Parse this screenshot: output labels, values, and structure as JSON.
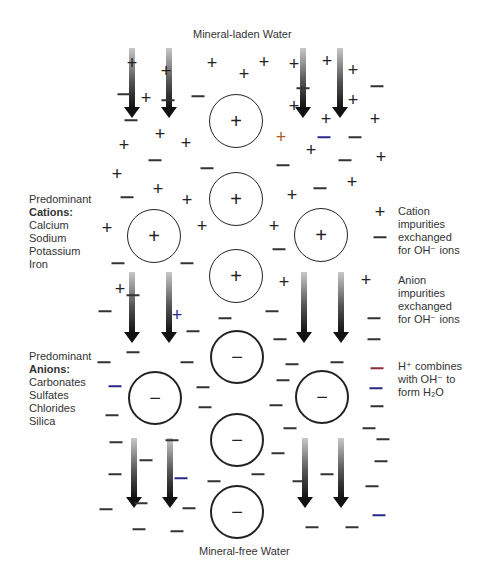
{
  "title_top": "Mineral-laden Water",
  "title_bottom": "Mineral-free Water",
  "left_labels": {
    "cations": {
      "heading": "Predominant",
      "bold": "Cations:",
      "items": [
        "Calcium",
        "Sodium",
        "Potassium",
        "Iron"
      ]
    },
    "anions": {
      "heading": "Predominant",
      "bold": "Anions:",
      "items": [
        "Carbonates",
        "Sulfates",
        "Chlorides",
        "Silica"
      ]
    }
  },
  "right_labels": {
    "cation_exchange": [
      "Cation",
      "impurities",
      "exchanged",
      "for OH⁻ ions"
    ],
    "anion_exchange": [
      "Anion",
      "impurities",
      "exchanged",
      "for OH⁻ ions"
    ],
    "h_combines": [
      "H⁺ combines",
      "with OH⁻ to",
      "form H₂O"
    ]
  },
  "colors": {
    "stroke": "#222222",
    "accent_red_dash": "#8a2a3a",
    "accent_blue_dash": "#2a2a8a",
    "accent_orange_plus": "#b0602a"
  },
  "resin_beads": [
    {
      "cx": 236,
      "cy": 121,
      "r": 27,
      "symbol": "+",
      "type": "cation"
    },
    {
      "cx": 236,
      "cy": 199,
      "r": 27,
      "symbol": "+",
      "type": "cation"
    },
    {
      "cx": 154,
      "cy": 236,
      "r": 27,
      "symbol": "+",
      "type": "cation"
    },
    {
      "cx": 321,
      "cy": 235,
      "r": 27,
      "symbol": "+",
      "type": "cation"
    },
    {
      "cx": 236,
      "cy": 276,
      "r": 27,
      "symbol": "+",
      "type": "cation"
    },
    {
      "cx": 237,
      "cy": 357,
      "r": 27,
      "symbol": "−",
      "type": "anion"
    },
    {
      "cx": 155,
      "cy": 398,
      "r": 27,
      "symbol": "−",
      "type": "anion"
    },
    {
      "cx": 322,
      "cy": 397,
      "r": 27,
      "symbol": "−",
      "type": "anion"
    },
    {
      "cx": 237,
      "cy": 440,
      "r": 27,
      "symbol": "−",
      "type": "anion"
    },
    {
      "cx": 237,
      "cy": 512,
      "r": 27,
      "symbol": "−",
      "type": "anion"
    }
  ],
  "flow_arrows": [
    {
      "x": 132,
      "y1": 48,
      "y2": 118
    },
    {
      "x": 169,
      "y1": 48,
      "y2": 118
    },
    {
      "x": 303,
      "y1": 48,
      "y2": 118
    },
    {
      "x": 340,
      "y1": 48,
      "y2": 118
    },
    {
      "x": 132,
      "y1": 272,
      "y2": 343
    },
    {
      "x": 169,
      "y1": 272,
      "y2": 343
    },
    {
      "x": 304,
      "y1": 272,
      "y2": 343
    },
    {
      "x": 341,
      "y1": 272,
      "y2": 343
    },
    {
      "x": 134,
      "y1": 438,
      "y2": 508
    },
    {
      "x": 170,
      "y1": 438,
      "y2": 508
    },
    {
      "x": 305,
      "y1": 438,
      "y2": 508
    },
    {
      "x": 341,
      "y1": 438,
      "y2": 508
    }
  ],
  "plus_ions": [
    {
      "x": 132,
      "y": 63
    },
    {
      "x": 166,
      "y": 71
    },
    {
      "x": 212,
      "y": 63
    },
    {
      "x": 244,
      "y": 74
    },
    {
      "x": 264,
      "y": 62
    },
    {
      "x": 294,
      "y": 64
    },
    {
      "x": 327,
      "y": 61
    },
    {
      "x": 353,
      "y": 70
    },
    {
      "x": 146,
      "y": 98
    },
    {
      "x": 294,
      "y": 106
    },
    {
      "x": 353,
      "y": 100
    },
    {
      "x": 326,
      "y": 119
    },
    {
      "x": 375,
      "y": 119
    },
    {
      "x": 124,
      "y": 145
    },
    {
      "x": 160,
      "y": 134
    },
    {
      "x": 186,
      "y": 143
    },
    {
      "x": 281,
      "y": 137,
      "color": "accent_orange_plus"
    },
    {
      "x": 311,
      "y": 150
    },
    {
      "x": 381,
      "y": 157
    },
    {
      "x": 117,
      "y": 174
    },
    {
      "x": 158,
      "y": 189
    },
    {
      "x": 187,
      "y": 200
    },
    {
      "x": 292,
      "y": 195
    },
    {
      "x": 352,
      "y": 182
    },
    {
      "x": 107,
      "y": 228
    },
    {
      "x": 202,
      "y": 226
    },
    {
      "x": 274,
      "y": 226
    },
    {
      "x": 380,
      "y": 212
    },
    {
      "x": 120,
      "y": 289
    },
    {
      "x": 284,
      "y": 282
    },
    {
      "x": 366,
      "y": 280
    },
    {
      "x": 177,
      "y": 315,
      "color": "accent_blue_dash"
    }
  ],
  "minus_ions": [
    {
      "x": 124,
      "y": 94
    },
    {
      "x": 168,
      "y": 100
    },
    {
      "x": 198,
      "y": 96
    },
    {
      "x": 303,
      "y": 88
    },
    {
      "x": 377,
      "y": 86
    },
    {
      "x": 131,
      "y": 120
    },
    {
      "x": 355,
      "y": 137
    },
    {
      "x": 324,
      "y": 137,
      "color": "accent_blue_dash"
    },
    {
      "x": 155,
      "y": 160
    },
    {
      "x": 207,
      "y": 168
    },
    {
      "x": 283,
      "y": 165
    },
    {
      "x": 345,
      "y": 160
    },
    {
      "x": 127,
      "y": 197
    },
    {
      "x": 320,
      "y": 188
    },
    {
      "x": 380,
      "y": 237
    },
    {
      "x": 279,
      "y": 249
    },
    {
      "x": 118,
      "y": 263
    },
    {
      "x": 187,
      "y": 263
    },
    {
      "x": 105,
      "y": 311
    },
    {
      "x": 133,
      "y": 295
    },
    {
      "x": 272,
      "y": 311
    },
    {
      "x": 225,
      "y": 318
    },
    {
      "x": 374,
      "y": 318
    },
    {
      "x": 193,
      "y": 331
    },
    {
      "x": 280,
      "y": 339
    },
    {
      "x": 374,
      "y": 339
    },
    {
      "x": 133,
      "y": 352
    },
    {
      "x": 104,
      "y": 362
    },
    {
      "x": 187,
      "y": 362
    },
    {
      "x": 292,
      "y": 364
    },
    {
      "x": 337,
      "y": 362
    },
    {
      "x": 115,
      "y": 386,
      "color": "accent_blue_dash"
    },
    {
      "x": 203,
      "y": 387
    },
    {
      "x": 283,
      "y": 380
    },
    {
      "x": 377,
      "y": 368,
      "color": "accent_red_dash"
    },
    {
      "x": 376,
      "y": 388,
      "color": "accent_blue_dash"
    },
    {
      "x": 112,
      "y": 415
    },
    {
      "x": 205,
      "y": 407
    },
    {
      "x": 276,
      "y": 405
    },
    {
      "x": 377,
      "y": 406
    },
    {
      "x": 290,
      "y": 428
    },
    {
      "x": 369,
      "y": 428
    },
    {
      "x": 116,
      "y": 442
    },
    {
      "x": 172,
      "y": 440
    },
    {
      "x": 278,
      "y": 453
    },
    {
      "x": 383,
      "y": 439
    },
    {
      "x": 146,
      "y": 460
    },
    {
      "x": 381,
      "y": 461
    },
    {
      "x": 115,
      "y": 474
    },
    {
      "x": 181,
      "y": 478,
      "color": "accent_blue_dash"
    },
    {
      "x": 214,
      "y": 481
    },
    {
      "x": 258,
      "y": 474
    },
    {
      "x": 299,
      "y": 481
    },
    {
      "x": 327,
      "y": 474
    },
    {
      "x": 372,
      "y": 486
    },
    {
      "x": 106,
      "y": 509
    },
    {
      "x": 141,
      "y": 503
    },
    {
      "x": 189,
      "y": 508
    },
    {
      "x": 379,
      "y": 515,
      "color": "accent_blue_dash"
    },
    {
      "x": 139,
      "y": 529
    },
    {
      "x": 177,
      "y": 531
    },
    {
      "x": 312,
      "y": 527
    },
    {
      "x": 352,
      "y": 527
    }
  ]
}
